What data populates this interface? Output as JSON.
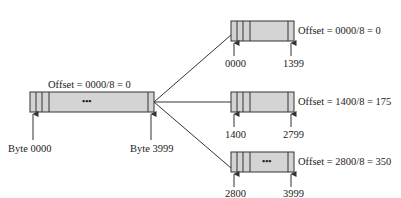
{
  "original": {
    "offset_label": "Offset = 0000/8 = 0",
    "start_label": "Byte 0000",
    "end_label": "Byte 3999",
    "ellipsis": "•••"
  },
  "fragments": [
    {
      "offset_label": "Offset = 0000/8 = 0",
      "start_label": "0000",
      "end_label": "1399",
      "ellipsis": ""
    },
    {
      "offset_label": "Offset = 1400/8 = 175",
      "start_label": "1400",
      "end_label": "2799",
      "ellipsis": ""
    },
    {
      "offset_label": "Offset = 2800/8 = 350",
      "start_label": "2800",
      "end_label": "3999",
      "ellipsis": "•••"
    }
  ],
  "colors": {
    "box_fill": "#d4d4d4",
    "stroke": "#333333"
  }
}
